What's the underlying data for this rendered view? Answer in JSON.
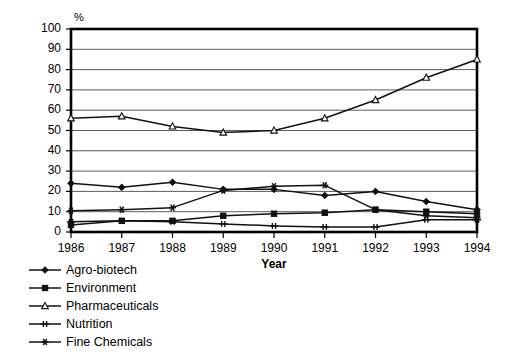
{
  "chart_data": {
    "type": "line",
    "title": "",
    "xlabel": "Year",
    "ylabel": "%",
    "unit_label": "%",
    "categories": [
      "1986",
      "1987",
      "1988",
      "1989",
      "1990",
      "1991",
      "1992",
      "1993",
      "1994"
    ],
    "x": [
      1986,
      1987,
      1988,
      1989,
      1990,
      1991,
      1992,
      1993,
      1994
    ],
    "xlim": [
      1986,
      1994
    ],
    "ylim": [
      0,
      100
    ],
    "yticks": [
      0,
      10,
      20,
      30,
      40,
      50,
      60,
      70,
      80,
      90,
      100
    ],
    "grid": "horizontal",
    "legend_position": "below-left",
    "series": [
      {
        "name": "Agro-biotech",
        "marker": "filled-diamond",
        "values": [
          24,
          22,
          24.5,
          21,
          21,
          18,
          20,
          15,
          11
        ]
      },
      {
        "name": "Environment",
        "marker": "filled-square",
        "values": [
          3.5,
          5.5,
          5.5,
          8,
          9,
          9.5,
          11,
          10,
          9
        ]
      },
      {
        "name": "Pharmaceuticals",
        "marker": "open-triangle",
        "values": [
          56,
          57,
          52,
          49,
          50,
          56,
          65,
          76,
          85
        ]
      },
      {
        "name": "Nutrition",
        "marker": "dash-cross",
        "values": [
          5,
          5.5,
          5,
          4,
          3,
          2.5,
          2.5,
          6,
          6
        ]
      },
      {
        "name": "Fine Chemicals",
        "marker": "asterisk",
        "values": [
          10.5,
          11,
          12,
          20.5,
          22.5,
          23,
          11,
          8,
          7
        ]
      }
    ]
  },
  "axis": {
    "y_unit": "%",
    "x_title": "Year"
  },
  "legend": {
    "items": [
      {
        "label": "Agro-biotech",
        "marker": "filled-diamond"
      },
      {
        "label": "Environment",
        "marker": "filled-square"
      },
      {
        "label": "Pharmaceuticals",
        "marker": "open-triangle"
      },
      {
        "label": "Nutrition",
        "marker": "dash-cross"
      },
      {
        "label": "Fine Chemicals",
        "marker": "asterisk"
      }
    ]
  },
  "colors": {
    "line": "#111111",
    "grid": "#4a4a4a",
    "frame": "#000000",
    "background": "#ffffff"
  }
}
